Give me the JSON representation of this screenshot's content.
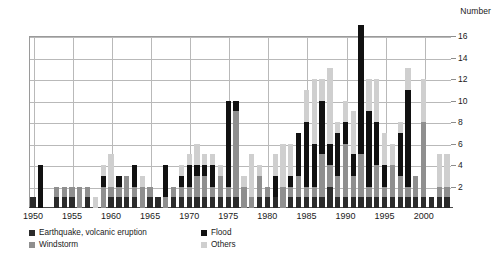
{
  "chart_data": {
    "type": "bar",
    "stacked": true,
    "title": "",
    "subtitle": "",
    "xlabel": "",
    "ylabel": "Number",
    "ylim": [
      0,
      16
    ],
    "ytick_values": [
      2,
      4,
      6,
      8,
      10,
      12,
      14,
      16
    ],
    "ytick_labels": [
      "2",
      "4",
      "6",
      "8",
      "10",
      "12",
      "14",
      "16"
    ],
    "xtick_labels": [
      "1950",
      "1955",
      "1960",
      "1965",
      "1970",
      "1975",
      "1980",
      "1985",
      "1990",
      "1995",
      "2000"
    ],
    "xtick_years": [
      1950,
      1955,
      1960,
      1965,
      1970,
      1975,
      1980,
      1985,
      1990,
      1995,
      2000
    ],
    "grid": "horizontal-and-vertical",
    "legend_position": "below-axis",
    "series": [
      {
        "name": "Earthquake, volcanic eruption",
        "key": "earthquake",
        "color": "#2b2b2b",
        "values": [
          1,
          0,
          0,
          1,
          1,
          1,
          0,
          1,
          0,
          0,
          1,
          1,
          1,
          1,
          0,
          1,
          1,
          0,
          1,
          1,
          1,
          1,
          1,
          1,
          1,
          1,
          1,
          0,
          0,
          1,
          1,
          1,
          0,
          1,
          1,
          1,
          1,
          1,
          2,
          1,
          1,
          1,
          1,
          1,
          1,
          1,
          1,
          1,
          1,
          1,
          1,
          1,
          1,
          1
        ]
      },
      {
        "name": "Windstorm",
        "key": "windstorm",
        "color": "#8f8f8f",
        "values": [
          0,
          0,
          0,
          1,
          1,
          1,
          2,
          1,
          0,
          2,
          1,
          1,
          2,
          1,
          2,
          1,
          0,
          1,
          1,
          1,
          1,
          2,
          2,
          1,
          2,
          1,
          8,
          2,
          1,
          2,
          1,
          0,
          2,
          1,
          2,
          1,
          1,
          4,
          2,
          2,
          5,
          2,
          4,
          1,
          3,
          1,
          3,
          2,
          1,
          2,
          7,
          0,
          1,
          1
        ]
      },
      {
        "name": "Flood",
        "key": "flood",
        "color": "#111111",
        "values": [
          0,
          4,
          0,
          0,
          0,
          0,
          0,
          0,
          0,
          1,
          0,
          1,
          0,
          2,
          0,
          0,
          0,
          3,
          0,
          1,
          2,
          1,
          1,
          2,
          0,
          8,
          1,
          0,
          0,
          0,
          0,
          2,
          0,
          1,
          4,
          6,
          4,
          5,
          2,
          4,
          2,
          2,
          12,
          7,
          4,
          2,
          0,
          4,
          9,
          0,
          0,
          0,
          0,
          0
        ]
      },
      {
        "name": "Others",
        "key": "others",
        "color": "#cfcfcf",
        "values": [
          0,
          0,
          0,
          0,
          0,
          0,
          0,
          0,
          1,
          1,
          3,
          0,
          0,
          0,
          1,
          0,
          0,
          0,
          0,
          1,
          1,
          2,
          1,
          1,
          1,
          0,
          0,
          1,
          4,
          1,
          0,
          2,
          4,
          3,
          0,
          3,
          6,
          2,
          7,
          1,
          2,
          4,
          0,
          3,
          4,
          3,
          2,
          1,
          2,
          0,
          4,
          0,
          3,
          3
        ]
      }
    ],
    "x": [
      1950,
      1951,
      1952,
      1953,
      1954,
      1955,
      1956,
      1957,
      1958,
      1959,
      1960,
      1961,
      1962,
      1963,
      1964,
      1965,
      1966,
      1967,
      1968,
      1969,
      1970,
      1971,
      1972,
      1973,
      1974,
      1975,
      1976,
      1977,
      1978,
      1979,
      1980,
      1981,
      1982,
      1983,
      1984,
      1985,
      1986,
      1987,
      1988,
      1989,
      1990,
      1991,
      1992,
      1993,
      1994,
      1995,
      1996,
      1997,
      1998,
      1999,
      2000,
      2001,
      2002,
      2003
    ],
    "totals": [
      1,
      4,
      0,
      2,
      2,
      2,
      2,
      2,
      1,
      4,
      5,
      3,
      3,
      4,
      3,
      2,
      1,
      4,
      2,
      4,
      5,
      6,
      5,
      5,
      4,
      10,
      10,
      3,
      5,
      4,
      2,
      5,
      6,
      6,
      7,
      11,
      12,
      12,
      13,
      8,
      10,
      9,
      17,
      12,
      12,
      7,
      6,
      8,
      13,
      3,
      12,
      1,
      4,
      5
    ]
  },
  "legend": {
    "items": [
      {
        "label": "Earthquake, volcanic eruption",
        "color": "#2b2b2b"
      },
      {
        "label": "Flood",
        "color": "#111111"
      },
      {
        "label": "Windstorm",
        "color": "#8f8f8f"
      },
      {
        "label": "Others",
        "color": "#cfcfcf"
      }
    ]
  }
}
